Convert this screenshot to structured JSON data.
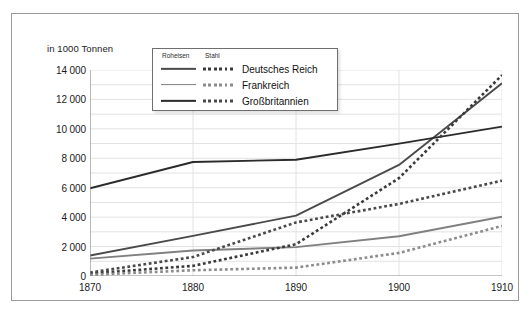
{
  "chart_data": {
    "type": "line",
    "title": "",
    "ylabel": "in 1000 Tonnen",
    "xlabel": "",
    "x": [
      1870,
      1880,
      1890,
      1900,
      1910
    ],
    "xlim": [
      1870,
      1910
    ],
    "ylim": [
      0,
      14000
    ],
    "ytick_step": 2000,
    "yminor_step": 1000,
    "grid": true,
    "legend_position": "top-center",
    "legend_columns": [
      "Roheisen",
      "Stahl"
    ],
    "ytick_labels": [
      "0",
      "2 000",
      "4 000",
      "6 000",
      "8 000",
      "10 000",
      "12 000",
      "14 000"
    ],
    "xtick_labels": [
      "1870",
      "1880",
      "1890",
      "1900",
      "1910"
    ],
    "series": [
      {
        "name": "Deutsches Reich",
        "product": "Roheisen",
        "style": "solid",
        "color": "#4a4a4a",
        "values": [
          1390,
          2730,
          4100,
          7550,
          13100
        ]
      },
      {
        "name": "Frankreich",
        "product": "Roheisen",
        "style": "solid",
        "color": "#808080",
        "values": [
          1180,
          1730,
          1960,
          2700,
          4030
        ]
      },
      {
        "name": "Großbritannien",
        "product": "Roheisen",
        "style": "solid",
        "color": "#2b2b2b",
        "values": [
          5960,
          7750,
          7900,
          9000,
          10150
        ]
      },
      {
        "name": "Deutsches Reich",
        "product": "Stahl",
        "style": "dotted",
        "color": "#3a3a3a",
        "values": [
          170,
          690,
          2160,
          6650,
          13650
        ]
      },
      {
        "name": "Frankreich",
        "product": "Stahl",
        "style": "dotted",
        "color": "#8c8c8c",
        "values": [
          80,
          390,
          570,
          1570,
          3400
        ]
      },
      {
        "name": "Großbritannien",
        "product": "Stahl",
        "style": "dotted",
        "color": "#4a4a4a",
        "values": [
          240,
          1290,
          3640,
          4900,
          6480
        ]
      }
    ]
  },
  "legend": {
    "col_roheisen": "Roheisen",
    "col_stahl": "Stahl",
    "rows": [
      {
        "label": "Deutsches Reich",
        "solid_color": "#4a4a4a",
        "dot_color": "#3a3a3a"
      },
      {
        "label": "Frankreich",
        "solid_color": "#808080",
        "dot_color": "#8c8c8c"
      },
      {
        "label": "Großbritannien",
        "solid_color": "#2b2b2b",
        "dot_color": "#4a4a4a"
      }
    ]
  },
  "colors": {
    "frame": "#9a9a9a",
    "axis": "#8a8a8a",
    "grid": "#e2e2e2",
    "text": "#1a1a1a",
    "background": "#ffffff"
  }
}
